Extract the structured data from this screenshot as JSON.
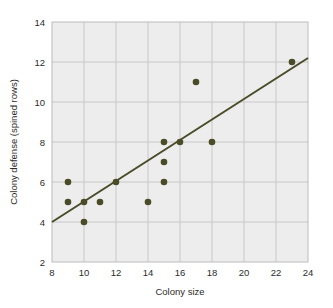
{
  "chart_data": {
    "type": "scatter",
    "title": "",
    "xlabel": "Colony size",
    "ylabel": "Colony defense (spined rows)",
    "xlim": [
      8,
      24
    ],
    "ylim": [
      2,
      14
    ],
    "xticks": [
      8,
      10,
      12,
      14,
      16,
      18,
      20,
      22,
      24
    ],
    "yticks": [
      2,
      4,
      6,
      8,
      10,
      12,
      14
    ],
    "grid": true,
    "legend": "none",
    "point_color": "#4a4c28",
    "line_color": "#4a4c28",
    "plot_background": "#ededed",
    "grid_color": "#c8c8c8",
    "points": [
      {
        "x": 9,
        "y": 6
      },
      {
        "x": 9,
        "y": 5
      },
      {
        "x": 10,
        "y": 5
      },
      {
        "x": 10,
        "y": 4
      },
      {
        "x": 11,
        "y": 5
      },
      {
        "x": 12,
        "y": 6
      },
      {
        "x": 14,
        "y": 5
      },
      {
        "x": 15,
        "y": 8
      },
      {
        "x": 15,
        "y": 7
      },
      {
        "x": 15,
        "y": 6
      },
      {
        "x": 16,
        "y": 8
      },
      {
        "x": 17,
        "y": 11
      },
      {
        "x": 18,
        "y": 8
      },
      {
        "x": 23,
        "y": 12
      }
    ],
    "trend_line": {
      "x1": 8,
      "y1": 4.0,
      "x2": 24,
      "y2": 12.2
    }
  }
}
